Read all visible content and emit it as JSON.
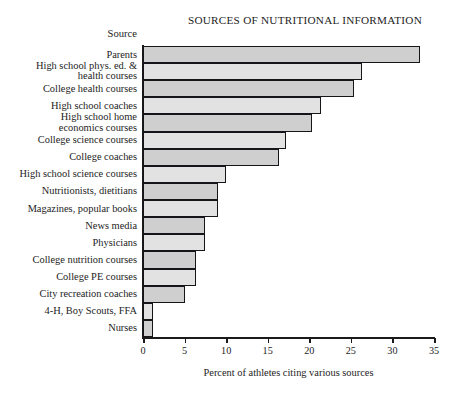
{
  "chart_data": {
    "type": "bar",
    "orientation": "horizontal",
    "title": "SOURCES OF NUTRITIONAL INFORMATION",
    "category_axis_title": "Source",
    "xlabel": "Percent of athletes citing various sources",
    "ylabel": "",
    "xlim": [
      0,
      35
    ],
    "xticks": [
      0,
      5,
      10,
      15,
      20,
      25,
      30,
      35
    ],
    "xtick_labels": [
      "0",
      "5",
      "10",
      "15",
      "20",
      "25",
      "30",
      "35"
    ],
    "grid": false,
    "legend": null,
    "bar_fill_dark": "#cfcfcf",
    "bar_fill_light": "#e2e2e2",
    "bar_edge": "#15151a",
    "categories": [
      "Parents",
      "High school phys. ed. &\nhealth courses",
      "College health courses",
      "High school coaches",
      "High school home\neconomics courses",
      "College science courses",
      "College coaches",
      "High school science courses",
      "Nutritionists, dietitians",
      "Magazines, popular books",
      "News media",
      "Physicians",
      "College nutrition courses",
      "College PE courses",
      "City recreation coaches",
      "4-H, Boy Scouts, FFA",
      "Nurses"
    ],
    "values": [
      33.3,
      26.3,
      25.4,
      21.4,
      20.3,
      17.2,
      16.3,
      10.0,
      9.0,
      9.0,
      7.5,
      7.5,
      6.4,
      6.4,
      5.0,
      1.2,
      1.2
    ]
  }
}
